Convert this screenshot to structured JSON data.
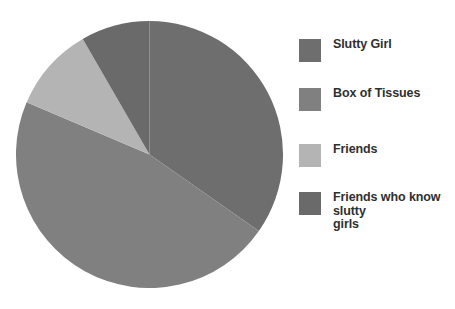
{
  "chart_data": {
    "type": "pie",
    "title": "",
    "title_note": "title is cropped off at the top edge of the screenshot and illegible",
    "categories": [
      "Slutty Girl",
      "Box of Tissues",
      "Friends",
      "Friends who know slutty girls"
    ],
    "values": [
      34.7,
      46.7,
      10.3,
      8.3
    ],
    "units": "percent",
    "colors": [
      "#6e6e6e",
      "#808080",
      "#b4b4b4",
      "#6a6a6a"
    ],
    "start_angle_deg": 0,
    "direction": "clockwise",
    "slices": [
      {
        "label": "Slutty Girl",
        "value": 34.7,
        "start_deg": 0,
        "end_deg": 125,
        "color": "#6e6e6e"
      },
      {
        "label": "Box of Tissues",
        "value": 46.7,
        "start_deg": 125,
        "end_deg": 293,
        "color": "#808080"
      },
      {
        "label": "Friends",
        "value": 10.3,
        "start_deg": 293,
        "end_deg": 330,
        "color": "#b4b4b4"
      },
      {
        "label": "Friends who know slutty girls",
        "value": 8.3,
        "start_deg": 330,
        "end_deg": 360,
        "color": "#6a6a6a"
      }
    ],
    "legend_position": "right",
    "grid": false,
    "xlabel": "",
    "ylabel": ""
  },
  "legend": {
    "items": [
      {
        "label": "Slutty Girl",
        "color": "#6e6e6e",
        "top": 0
      },
      {
        "label": "Box of Tissues",
        "color": "#808080",
        "top": 49
      },
      {
        "label": "Friends",
        "color": "#b4b4b4",
        "top": 105
      },
      {
        "label": "Friends who know slutty\ngirls",
        "color": "#6a6a6a",
        "top": 153
      }
    ]
  }
}
